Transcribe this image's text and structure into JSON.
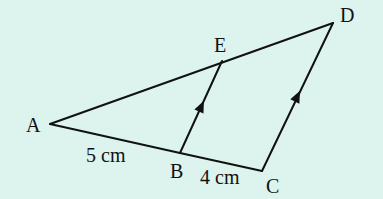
{
  "diagram": {
    "background": "#dcf3ee",
    "line_color": "#111111",
    "points": {
      "A": {
        "label": "A",
        "x": 50,
        "y": 124
      },
      "B": {
        "label": "B",
        "x": 180,
        "y": 153
      },
      "C": {
        "label": "C",
        "x": 262,
        "y": 171
      },
      "D": {
        "label": "D",
        "x": 333,
        "y": 23
      },
      "E": {
        "label": "E",
        "x": 222,
        "y": 61
      }
    },
    "segments": [
      "AD",
      "AB",
      "BC",
      "BE",
      "CD"
    ],
    "parallel_marks": [
      "BE",
      "CD"
    ],
    "measurements": {
      "AB": "5 cm",
      "BC": "4 cm"
    }
  }
}
